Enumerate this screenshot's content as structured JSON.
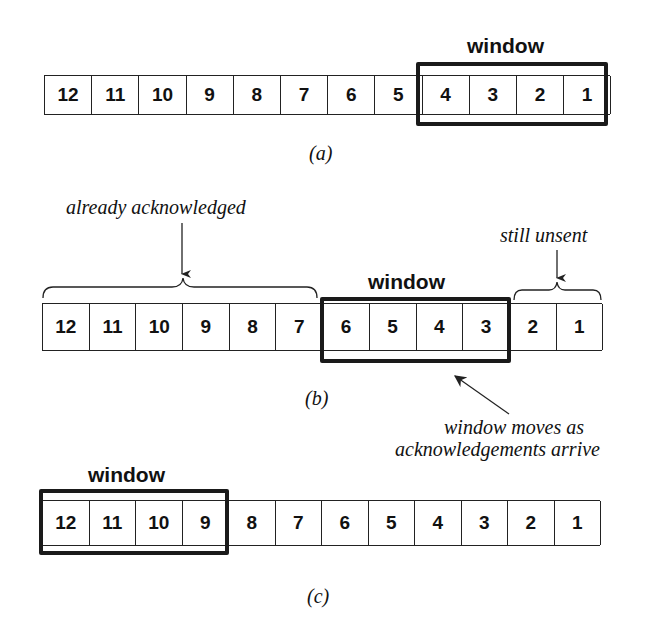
{
  "panels": [
    {
      "id": "a",
      "caption": "(a)",
      "cells": [
        "12",
        "11",
        "10",
        "9",
        "8",
        "7",
        "6",
        "5",
        "4",
        "3",
        "2",
        "1"
      ],
      "window_label": "window",
      "window_range": [
        "4",
        "1"
      ]
    },
    {
      "id": "b",
      "caption": "(b)",
      "cells": [
        "12",
        "11",
        "10",
        "9",
        "8",
        "7",
        "6",
        "5",
        "4",
        "3",
        "2",
        "1"
      ],
      "window_label": "window",
      "window_range": [
        "6",
        "3"
      ],
      "annotations": {
        "acknowledged": "already acknowledged",
        "unsent": "still unsent",
        "moves_line1": "window moves as",
        "moves_line2": "acknowledgements arrive"
      }
    },
    {
      "id": "c",
      "caption": "(c)",
      "cells": [
        "12",
        "11",
        "10",
        "9",
        "8",
        "7",
        "6",
        "5",
        "4",
        "3",
        "2",
        "1"
      ],
      "window_label": "window",
      "window_range": [
        "12",
        "9"
      ]
    }
  ],
  "colors": {
    "line": "#222222",
    "background": "#ffffff"
  }
}
